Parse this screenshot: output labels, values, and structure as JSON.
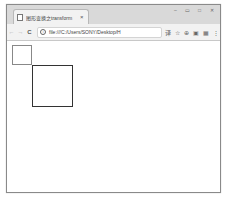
{
  "window": {
    "controls": [
      "minimize",
      "restore",
      "maximize",
      "close"
    ],
    "control_glyphs": [
      "–",
      "▭",
      "□",
      "✕"
    ]
  },
  "tab": {
    "title": "图形变换之transform",
    "close_glyph": "×"
  },
  "toolbar": {
    "back_glyph": "←",
    "forward_glyph": "→",
    "reload_glyph": "C",
    "address": "file:///C:/Users/SONY/Desktop/H",
    "info_glyph": "i",
    "icons": [
      {
        "name": "translate-icon",
        "glyph": "译"
      },
      {
        "name": "star-icon",
        "glyph": "☆"
      },
      {
        "name": "extension-icon",
        "glyph": "⊕"
      },
      {
        "name": "cast-icon",
        "glyph": "▣"
      },
      {
        "name": "screenshot-icon",
        "glyph": "▦"
      },
      {
        "name": "menu-icon",
        "glyph": "⋮"
      }
    ]
  },
  "content": {
    "shapes": [
      {
        "name": "original-square",
        "x": 5,
        "y": 4,
        "w": 20,
        "h": 20,
        "border": "#888888"
      },
      {
        "name": "transformed-square",
        "x": 25,
        "y": 24,
        "w": 41,
        "h": 42,
        "border": "#333333"
      }
    ]
  }
}
